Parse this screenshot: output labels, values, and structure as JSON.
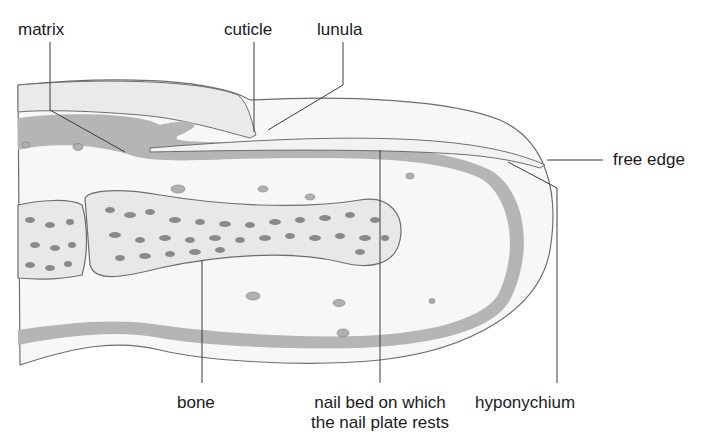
{
  "diagram": {
    "colors": {
      "tissue_dark": "#b5b5b5",
      "tissue_light": "#e6e6e6",
      "nail": "#f2f2f2",
      "outline": "#6e6e6e",
      "leader": "#3a3a3a",
      "text": "#1a1a1a"
    },
    "labels": {
      "matrix": "matrix",
      "cuticle": "cuticle",
      "lunula": "lunula",
      "free_edge": "free edge",
      "bone": "bone",
      "nail_bed_line1": "nail bed on which",
      "nail_bed_line2": "the nail plate rests",
      "hyponychium": "hyponychium"
    }
  }
}
